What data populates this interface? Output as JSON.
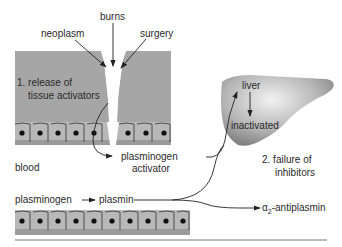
{
  "labels": {
    "burns": "burns",
    "neoplasm": "neoplasm",
    "surgery": "surgery",
    "release_line1": "1.  release of",
    "release_line2": "tissue activators",
    "liver": "liver",
    "inactivated": "inactivated",
    "blood": "blood",
    "pa_line1": "plasminogen",
    "pa_line2": "activator",
    "failure_line1": "2.  failure of",
    "failure_line2": "inhibitors",
    "plasminogen": "plasminogen",
    "plasmin": "plasmin",
    "antiplasmin_alpha": "α",
    "antiplasmin_sub": "2",
    "antiplasmin_rest": "-antiplasmin"
  },
  "colors": {
    "tissue": "#a3a3a3",
    "cell": "#bdbdbd",
    "nucleus": "#111111",
    "liver_dark": "#8a8a8a",
    "liver_light": "#e6e6e6",
    "line": "#222222"
  }
}
